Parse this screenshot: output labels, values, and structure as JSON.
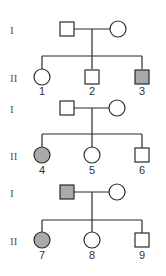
{
  "colors": {
    "stroke": "#2b2b2b",
    "affected_fill": "#a9a9a9",
    "unaffected_fill": "#ffffff"
  },
  "families": [
    {
      "generation_labels": {
        "parents": "I",
        "children": "II"
      },
      "parents": {
        "father": {
          "sex": "male",
          "affected": false
        },
        "mother": {
          "sex": "female",
          "affected": false
        }
      },
      "children": [
        {
          "id": "1",
          "sex": "female",
          "affected": false
        },
        {
          "id": "2",
          "sex": "male",
          "affected": false
        },
        {
          "id": "3",
          "sex": "male",
          "affected": true
        }
      ]
    },
    {
      "generation_labels": {
        "parents": "I",
        "children": "II"
      },
      "parents": {
        "father": {
          "sex": "male",
          "affected": false
        },
        "mother": {
          "sex": "female",
          "affected": false
        }
      },
      "children": [
        {
          "id": "4",
          "sex": "female",
          "affected": true
        },
        {
          "id": "5",
          "sex": "female",
          "affected": false
        },
        {
          "id": "6",
          "sex": "male",
          "affected": false
        }
      ]
    },
    {
      "generation_labels": {
        "parents": "I",
        "children": "II"
      },
      "parents": {
        "father": {
          "sex": "male",
          "affected": true
        },
        "mother": {
          "sex": "female",
          "affected": false
        }
      },
      "children": [
        {
          "id": "7",
          "sex": "female",
          "affected": true
        },
        {
          "id": "8",
          "sex": "female",
          "affected": false
        },
        {
          "id": "9",
          "sex": "male",
          "affected": false
        }
      ]
    }
  ]
}
